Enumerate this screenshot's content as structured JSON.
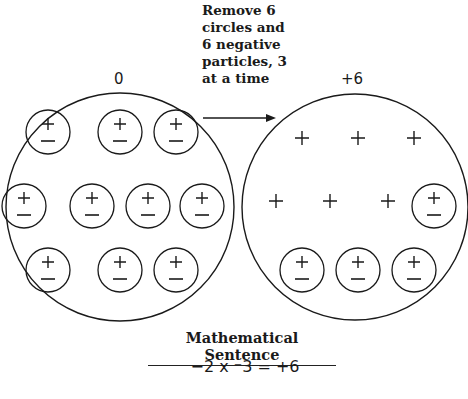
{
  "caption": "Remove 6\ncircles and\n6 negative\nparticles, 3\nat a time",
  "left_circle": {
    "label": "0",
    "pairs": [
      [
        48,
        132
      ],
      [
        120,
        132
      ],
      [
        176,
        132
      ],
      [
        24,
        206
      ],
      [
        92,
        206
      ],
      [
        148,
        206
      ],
      [
        202,
        206
      ],
      [
        48,
        270
      ],
      [
        120,
        270
      ],
      [
        176,
        270
      ]
    ]
  },
  "right_circle": {
    "label": "+6",
    "free_positives": [
      [
        302,
        138
      ],
      [
        358,
        138
      ],
      [
        414,
        138
      ],
      [
        276,
        201
      ],
      [
        330,
        201
      ],
      [
        388,
        201
      ]
    ],
    "pairs": [
      [
        434,
        206
      ],
      [
        302,
        270
      ],
      [
        358,
        270
      ],
      [
        414,
        270
      ]
    ]
  },
  "sentence": {
    "title": "Mathematical Sentence",
    "equation": "−2 x ⁻3 = +6"
  },
  "colors": {
    "ink": "#1a1a1a",
    "background": "#ffffff"
  }
}
